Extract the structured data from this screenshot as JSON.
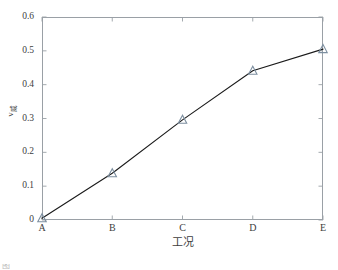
{
  "chart_data": {
    "type": "line",
    "title": "",
    "subtitle": "",
    "xlabel": "工况",
    "ylabel": "ν",
    "ylabel_sub": "威",
    "categories": [
      "A",
      "B",
      "C",
      "D",
      "E"
    ],
    "values": [
      0.005,
      0.138,
      0.296,
      0.441,
      0.505
    ],
    "series": [
      {
        "name": "ν",
        "values": [
          0.005,
          0.138,
          0.296,
          0.441,
          0.505
        ],
        "marker": "triangle-up-open",
        "marker_edge_color": "#7d8fa0",
        "line_color": "#1a1a1a"
      }
    ],
    "ylim": [
      0,
      0.6
    ],
    "yticks": [
      0,
      0.1,
      0.2,
      0.3,
      0.4,
      0.5,
      0.6
    ],
    "ytick_labels": [
      "0",
      "0.1",
      "0.2",
      "0.3",
      "0.4",
      "0.5",
      "0.6"
    ],
    "xticks": [
      "A",
      "B",
      "C",
      "D",
      "E"
    ],
    "grid": false,
    "legend": false,
    "box": true,
    "tick_direction": "in"
  },
  "axes": {
    "frame_color": "#9aa0a6",
    "text_color": "#3d3d3d"
  },
  "caption": {
    "text": "图"
  }
}
